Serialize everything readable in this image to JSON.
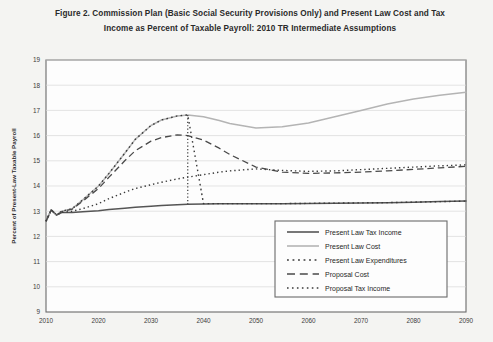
{
  "figure": {
    "title_line_1": "Figure 2.  Commission Plan (Basic Social Security Provisions Only) and Present Law Cost and Tax",
    "title_line_2": "Income as Percent of Taxable Payroll: 2010 TR Intermediate Assumptions",
    "background_color": "#f4f4f2",
    "plot_background_color": "#fdfdfd",
    "frame_color": "#6b6b6b"
  },
  "chart_data": {
    "type": "line",
    "title": "Figure 2.  Commission Plan (Basic Social Security Provisions Only) and Present Law Cost and Tax Income as Percent of Taxable Payroll: 2010 TR Intermediate Assumptions",
    "xlabel": "",
    "ylabel": "Percent of Present-Law Taxable Payroll",
    "xlim": [
      2010,
      2090
    ],
    "ylim": [
      9,
      19
    ],
    "xticks": [
      2010,
      2020,
      2030,
      2040,
      2050,
      2060,
      2070,
      2080,
      2090
    ],
    "yticks": [
      9,
      10,
      11,
      12,
      13,
      14,
      15,
      16,
      17,
      18,
      19
    ],
    "grid": "horizontal",
    "legend_position": "inside-lower-right",
    "x": [
      2010,
      2011,
      2012,
      2013,
      2015,
      2017,
      2020,
      2022,
      2025,
      2027,
      2030,
      2032,
      2035,
      2037,
      2040,
      2043,
      2045,
      2050,
      2055,
      2060,
      2065,
      2070,
      2075,
      2080,
      2085,
      2090
    ],
    "series": [
      {
        "name": "Present Law Tax Income",
        "style": "solid",
        "color": "#555555",
        "width": 1.5,
        "values": [
          12.6,
          13.05,
          12.85,
          12.95,
          12.95,
          12.98,
          13.02,
          13.07,
          13.12,
          13.16,
          13.2,
          13.23,
          13.26,
          13.28,
          13.29,
          13.3,
          13.3,
          13.3,
          13.3,
          13.31,
          13.32,
          13.33,
          13.34,
          13.36,
          13.38,
          13.4
        ]
      },
      {
        "name": "Present Law Cost",
        "style": "solid",
        "color": "#b4b4b4",
        "width": 1.5,
        "values": [
          12.6,
          13.05,
          12.85,
          13.0,
          13.1,
          13.45,
          14.0,
          14.5,
          15.3,
          15.85,
          16.4,
          16.62,
          16.78,
          16.82,
          16.75,
          16.6,
          16.48,
          16.3,
          16.35,
          16.5,
          16.75,
          17.0,
          17.25,
          17.45,
          17.6,
          17.72
        ]
      },
      {
        "name": "Present Law Expenditures",
        "style": "square-dot",
        "color": "#3a3a3a",
        "width": 1.4,
        "values": [
          12.6,
          13.05,
          12.85,
          13.0,
          13.1,
          13.45,
          14.0,
          14.5,
          15.3,
          15.85,
          16.4,
          16.62,
          16.78,
          16.82,
          13.3,
          13.3,
          13.3,
          13.3,
          13.3,
          13.31,
          13.32,
          13.33,
          13.34,
          13.36,
          13.38,
          13.4
        ]
      },
      {
        "name": "Proposal Cost",
        "style": "long-dash",
        "color": "#4a4a4a",
        "width": 1.3,
        "values": [
          12.6,
          13.05,
          12.85,
          12.98,
          13.08,
          13.4,
          13.9,
          14.35,
          15.0,
          15.4,
          15.78,
          15.92,
          16.03,
          16.0,
          15.82,
          15.5,
          15.25,
          14.75,
          14.55,
          14.5,
          14.52,
          14.55,
          14.6,
          14.66,
          14.72,
          14.78
        ]
      },
      {
        "name": "Proposal Tax Income",
        "style": "dotted",
        "color": "#3a3a3a",
        "width": 1.4,
        "values": [
          12.6,
          13.05,
          12.85,
          12.95,
          13.0,
          13.1,
          13.3,
          13.5,
          13.75,
          13.9,
          14.05,
          14.15,
          14.28,
          14.35,
          14.45,
          14.55,
          14.6,
          14.68,
          14.62,
          14.58,
          14.6,
          14.65,
          14.7,
          14.75,
          14.8,
          14.84
        ]
      }
    ],
    "annotations": [
      {
        "name": "trust-fund-exhaustion-drop",
        "type": "vertical-drop",
        "x": 2037,
        "y_from": 16.82,
        "y_to": 13.28,
        "style": "dotted"
      }
    ]
  },
  "legend": {
    "items": [
      {
        "label": "Present Law Tax Income",
        "style": "solid",
        "color": "#555555"
      },
      {
        "label": "Present Law Cost",
        "style": "solid",
        "color": "#b4b4b4"
      },
      {
        "label": "Present Law Expenditures",
        "style": "square-dot",
        "color": "#3a3a3a"
      },
      {
        "label": "Proposal Cost",
        "style": "long-dash",
        "color": "#4a4a4a"
      },
      {
        "label": "Proposal Tax Income",
        "style": "dotted",
        "color": "#3a3a3a"
      }
    ]
  }
}
